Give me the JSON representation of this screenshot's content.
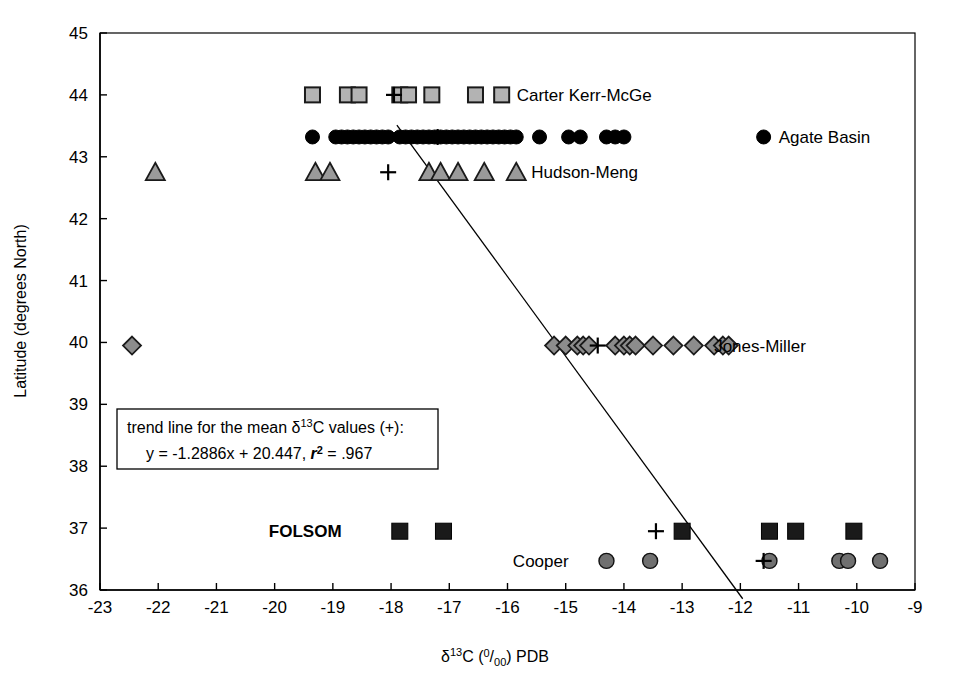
{
  "chart_data": {
    "type": "scatter",
    "title": "",
    "xlabel": "d13C (0/00) PDB",
    "xlabel_parts": {
      "delta": "δ",
      "sup": "13",
      "tail": "C (",
      "permil_num": "0",
      "permil_den": "00",
      "tail2": ") PDB"
    },
    "ylabel": "Latitude (degrees North)",
    "xlim": [
      -23,
      -9
    ],
    "ylim": [
      36,
      45
    ],
    "xticks": [
      -23,
      -22,
      -21,
      -20,
      -19,
      -18,
      -17,
      -16,
      -15,
      -14,
      -13,
      -12,
      -11,
      -10,
      -9
    ],
    "yticks": [
      36,
      37,
      38,
      39,
      40,
      41,
      42,
      43,
      44,
      45
    ],
    "xtick_labels": [
      "-23",
      "-22",
      "-21",
      "-20",
      "-19",
      "-18",
      "-17",
      "-16",
      "-15",
      "-14",
      "-13",
      "-12",
      "-11",
      "-10",
      "-9"
    ],
    "ytick_labels": [
      "36",
      "37",
      "38",
      "39",
      "40",
      "41",
      "42",
      "43",
      "44",
      "45"
    ],
    "grid": false,
    "legend_position": "inline-right-of-series",
    "series": [
      {
        "name": "Carter Kerr-McGe",
        "marker": "square",
        "fill": "#b3b3b3",
        "stroke": "#1a1a1a",
        "y": 44,
        "label_x": -16.1,
        "x": [
          -19.35,
          -18.75,
          -18.55,
          -17.85,
          -17.7,
          -17.3,
          -16.55
        ],
        "mean_x": -17.95
      },
      {
        "name": "Agate Basin",
        "marker": "circle",
        "fill": "#000000",
        "stroke": "#000000",
        "y": 43.32,
        "label_x": -11.6,
        "x": [
          -19.35,
          -18.95,
          -18.85,
          -18.75,
          -18.65,
          -18.55,
          -18.45,
          -18.35,
          -18.25,
          -18.15,
          -18.05,
          -17.85,
          -17.75,
          -17.65,
          -17.55,
          -17.45,
          -17.35,
          -17.25,
          -17.15,
          -17.05,
          -16.95,
          -16.85,
          -16.75,
          -16.65,
          -16.55,
          -16.45,
          -16.35,
          -16.25,
          -16.15,
          -16.05,
          -15.95,
          -15.85,
          -15.45,
          -14.95,
          -14.75,
          -14.3,
          -14.15,
          -14.0
        ],
        "mean_x": -17.2
      },
      {
        "name": "Hudson-Meng",
        "marker": "triangle",
        "fill": "#9a9a9a",
        "stroke": "#1a1a1a",
        "y": 42.75,
        "label_x": -15.85,
        "x": [
          -22.05,
          -19.3,
          -19.05,
          -17.35,
          -17.15,
          -16.85,
          -16.4
        ],
        "mean_x": -18.05
      },
      {
        "name": "Jones-Miller",
        "marker": "diamond",
        "fill": "#8c8c8c",
        "stroke": "#1a1a1a",
        "y": 39.95,
        "label_x": -12.45,
        "x": [
          -22.45,
          -15.2,
          -15.0,
          -14.8,
          -14.7,
          -14.6,
          -14.15,
          -14.0,
          -13.9,
          -13.8,
          -13.5,
          -13.15,
          -12.8,
          -12.45,
          -12.3,
          -12.2
        ],
        "mean_x": -14.45
      },
      {
        "name": "FOLSOM",
        "marker": "filled-square",
        "fill": "#1a1a1a",
        "stroke": "#000000",
        "y": 36.95,
        "label_x": -18.85,
        "label_bold": true,
        "x": [
          -17.85,
          -17.1,
          -13.0,
          -11.5,
          -11.05,
          -10.05
        ],
        "mean_x": -13.45
      },
      {
        "name": "Cooper",
        "marker": "filled-circle-gray",
        "fill": "#707070",
        "stroke": "#111111",
        "y": 36.47,
        "label_x": -14.95,
        "x": [
          -14.3,
          -13.55,
          -11.5,
          -10.3,
          -10.15,
          -9.6
        ],
        "mean_x": -11.6
      }
    ],
    "mean_markers": {
      "symbol": "+",
      "points": [
        {
          "x": -17.95,
          "y": 44
        },
        {
          "x": -17.2,
          "y": 43.32
        },
        {
          "x": -18.05,
          "y": 42.75
        },
        {
          "x": -14.45,
          "y": 39.95
        },
        {
          "x": -13.45,
          "y": 36.95
        },
        {
          "x": -11.6,
          "y": 36.47
        }
      ]
    },
    "trendline": {
      "slope": -1.2886,
      "intercept": 20.447,
      "r2": 0.967,
      "equation": "y = -1.2886x + 20.447",
      "r2_text": ".967",
      "x_start": -17.9,
      "x_end": -11.96
    },
    "annotation": {
      "line1_a": "trend line for the mean ",
      "line1_delta": "δ",
      "line1_sup": "13",
      "line1_b": "C values (+):",
      "line2_a": "y = -1.2886x + 20.447, ",
      "line2_r": "r",
      "line2_r_sup": "2",
      "line2_b": " = .967"
    }
  }
}
